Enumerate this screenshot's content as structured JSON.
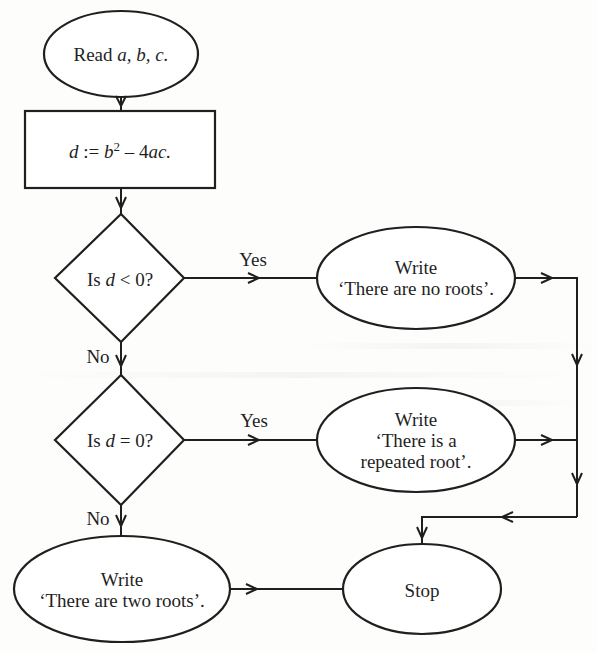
{
  "diagram": {
    "type": "flowchart",
    "title": "",
    "nodes": {
      "read": {
        "shape": "oval",
        "text_prefix": "Read ",
        "vars": "a, b, c."
      },
      "compute": {
        "shape": "rectangle",
        "lhs": "d",
        "assign": " := ",
        "b": "b",
        "exp": "2",
        "rest": " – 4",
        "ac": "ac."
      },
      "decision1": {
        "shape": "diamond",
        "prefix": "Is ",
        "var": "d",
        "suffix": " < 0?"
      },
      "no_roots": {
        "shape": "oval",
        "line1": "Write",
        "line2": "‘There are no roots’."
      },
      "decision2": {
        "shape": "diamond",
        "prefix": "Is ",
        "var": "d",
        "suffix": " = 0?"
      },
      "repeated_root": {
        "shape": "oval",
        "line1": "Write",
        "line2": "‘There is a",
        "line3": "repeated root’."
      },
      "two_roots": {
        "shape": "oval",
        "line1": "Write",
        "line2": "‘There are two roots’."
      },
      "stop": {
        "shape": "oval",
        "text": "Stop"
      }
    },
    "edges": [
      {
        "from": "read",
        "to": "compute",
        "label": ""
      },
      {
        "from": "compute",
        "to": "decision1",
        "label": ""
      },
      {
        "from": "decision1",
        "to": "no_roots",
        "label": "Yes"
      },
      {
        "from": "decision1",
        "to": "decision2",
        "label": "No"
      },
      {
        "from": "decision2",
        "to": "repeated_root",
        "label": "Yes"
      },
      {
        "from": "decision2",
        "to": "two_roots",
        "label": "No"
      },
      {
        "from": "no_roots",
        "to": "stop",
        "label": ""
      },
      {
        "from": "repeated_root",
        "to": "stop",
        "label": ""
      },
      {
        "from": "two_roots",
        "to": "stop",
        "label": ""
      }
    ],
    "edge_labels": {
      "d1_yes": "Yes",
      "d1_no": "No",
      "d2_yes": "Yes",
      "d2_no": "No"
    },
    "colors": {
      "stroke": "#1f1f1f",
      "background": "#fdfdfc",
      "fill": "#ffffff"
    }
  }
}
